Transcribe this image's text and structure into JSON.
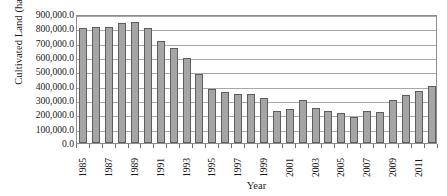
{
  "chart_data": {
    "type": "bar",
    "title": "",
    "xlabel": "Year",
    "ylabel": "Cultivated Land (ha)",
    "ylim": [
      0,
      900000
    ],
    "grid": true,
    "legend": "none",
    "y_tick_labels": [
      "900,000.0",
      "800,000.0",
      "700,000.0",
      "600,000.0",
      "500,000.0",
      "400,000.0",
      "300,000.0",
      "200,000.0",
      "100,000.0",
      "0.0"
    ],
    "y_tick_values": [
      900000,
      800000,
      700000,
      600000,
      500000,
      400000,
      300000,
      200000,
      100000,
      0
    ],
    "x_tick_labels": [
      "1985",
      "1987",
      "1989",
      "1991",
      "1993",
      "1995",
      "1997",
      "1999",
      "2001",
      "2003",
      "2005",
      "2007",
      "2009",
      "2011"
    ],
    "categories": [
      "1985",
      "1986",
      "1987",
      "1988",
      "1989",
      "1990",
      "1991",
      "1992",
      "1993",
      "1994",
      "1995",
      "1996",
      "1997",
      "1998",
      "1999",
      "2000",
      "2001",
      "2002",
      "2003",
      "2004",
      "2005",
      "2006",
      "2007",
      "2008",
      "2009",
      "2010",
      "2011",
      "2012"
    ],
    "values": [
      800000,
      810000,
      810000,
      835000,
      845000,
      800000,
      710000,
      660000,
      595000,
      480000,
      380000,
      358000,
      345000,
      342000,
      315000,
      225000,
      235000,
      300000,
      245000,
      220000,
      208000,
      180000,
      222000,
      215000,
      300000,
      335000,
      362000,
      400000
    ],
    "colors": {
      "bar_fill": "#a5a5a5",
      "bar_border": "#5e5e5e",
      "gridline": "#a8a8a8",
      "plot_border": "#8c8c8c",
      "text": "#1a1a1a",
      "background": "#ffffff"
    }
  }
}
